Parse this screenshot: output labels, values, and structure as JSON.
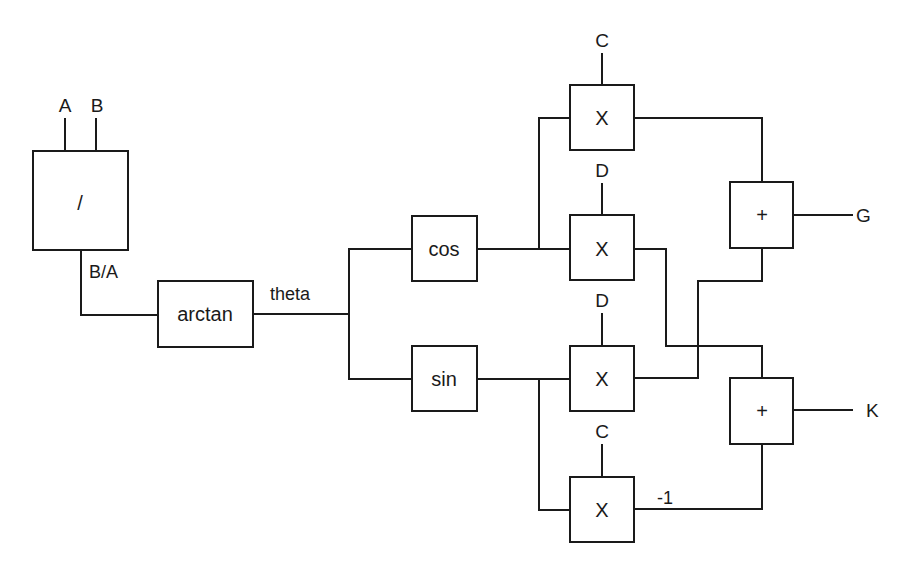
{
  "diagram": {
    "title": "",
    "colors": {
      "line": "#1a1a1a",
      "background": "#ffffff"
    },
    "inputs": {
      "a": "A",
      "b": "B",
      "c_top": "C",
      "d_upper": "D",
      "d_lower": "D",
      "c_bottom": "C"
    },
    "blocks": {
      "divide": "/",
      "arctan": "arctan",
      "cos": "cos",
      "sin": "sin",
      "mult1": "X",
      "mult2": "X",
      "mult3": "X",
      "mult4": "X",
      "adder_g": "+",
      "adder_k": "+"
    },
    "signals": {
      "ratio": "B/A",
      "theta": "theta",
      "neg_one": "-1"
    },
    "outputs": {
      "g": "G",
      "k": "K"
    }
  }
}
